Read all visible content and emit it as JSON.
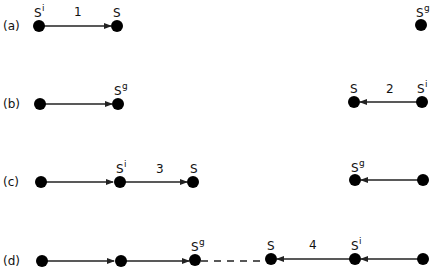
{
  "rows": [
    {
      "label": "(a)",
      "y": 26
    },
    {
      "label": "(b)",
      "y": 104
    },
    {
      "label": "(c)",
      "y": 181
    },
    {
      "label": "(d)",
      "y": 261
    }
  ],
  "state_symbol": "S",
  "superscripts": {
    "initial": "i",
    "goal": "g"
  },
  "edge_labels": [
    "1",
    "2",
    "3",
    "4"
  ],
  "colors": {
    "node": "#000000",
    "edge": "#222222"
  }
}
